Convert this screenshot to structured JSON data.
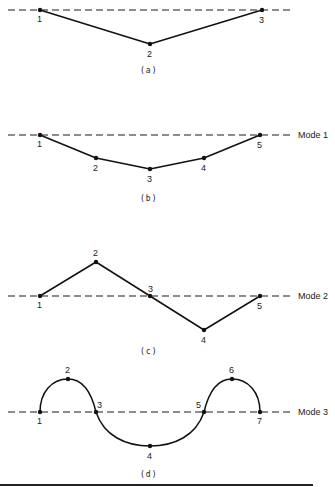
{
  "panels": [
    {
      "id": "a",
      "caption": "(a)",
      "mode_label": "",
      "baseline_y": 10,
      "curve": "polyline",
      "nodes": [
        {
          "label": "1",
          "x": 40,
          "y": 10
        },
        {
          "label": "2",
          "x": 150,
          "y": 44
        },
        {
          "label": "3",
          "x": 262,
          "y": 10
        }
      ]
    },
    {
      "id": "b",
      "caption": "(b)",
      "mode_label": "Mode 1",
      "baseline_y": 135,
      "curve": "polyline",
      "nodes": [
        {
          "label": "1",
          "x": 40,
          "y": 135
        },
        {
          "label": "2",
          "x": 96,
          "y": 158
        },
        {
          "label": "3",
          "x": 150,
          "y": 169
        },
        {
          "label": "4",
          "x": 204,
          "y": 158
        },
        {
          "label": "5",
          "x": 260,
          "y": 135
        }
      ]
    },
    {
      "id": "c",
      "caption": "(c)",
      "mode_label": "Mode 2",
      "baseline_y": 296,
      "curve": "polyline",
      "nodes": [
        {
          "label": "1",
          "x": 40,
          "y": 296
        },
        {
          "label": "2",
          "x": 96,
          "y": 262
        },
        {
          "label": "3",
          "x": 150,
          "y": 296
        },
        {
          "label": "4",
          "x": 204,
          "y": 330
        },
        {
          "label": "5",
          "x": 260,
          "y": 296
        }
      ]
    },
    {
      "id": "d",
      "caption": "(d)",
      "mode_label": "Mode 3",
      "baseline_y": 412,
      "curve": "smooth",
      "nodes": [
        {
          "label": "1",
          "x": 40,
          "y": 412
        },
        {
          "label": "2",
          "x": 68,
          "y": 379
        },
        {
          "label": "3",
          "x": 96,
          "y": 412
        },
        {
          "label": "4",
          "x": 150,
          "y": 446
        },
        {
          "label": "5",
          "x": 204,
          "y": 412
        },
        {
          "label": "6",
          "x": 232,
          "y": 379
        },
        {
          "label": "7",
          "x": 260,
          "y": 412
        }
      ]
    }
  ]
}
